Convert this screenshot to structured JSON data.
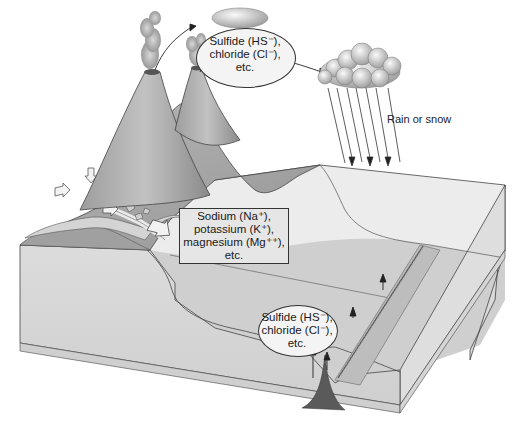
{
  "diagram": {
    "title": "",
    "labels": {
      "atmosphere_oval": {
        "line1": "Sulfide (HS⁻),",
        "line2": "chloride (Cl⁻),",
        "line3": "etc."
      },
      "river_box": {
        "line1": "Sodium (Na⁺),",
        "line2": "potassium (K⁺),",
        "line3": "magnesium (Mg⁺⁺),",
        "line4": "etc."
      },
      "vent_oval": {
        "line1": "Sulfide (HS⁻),",
        "line2": "chloride (Cl⁻),",
        "line3": "etc."
      },
      "rain": "Rain or snow"
    },
    "elements": [
      {
        "name": "volcano-left",
        "kind": "volcano"
      },
      {
        "name": "volcano-right",
        "kind": "volcano"
      },
      {
        "name": "emission-cloud",
        "kind": "cloud"
      },
      {
        "name": "rain-cloud",
        "kind": "cloud"
      },
      {
        "name": "rain-streaks",
        "kind": "precipitation",
        "count": 7
      },
      {
        "name": "river",
        "kind": "runoff",
        "flow_arrows": 6
      },
      {
        "name": "ocean-block",
        "kind": "cross-section"
      },
      {
        "name": "mid-ocean-ridge",
        "kind": "ridge"
      },
      {
        "name": "hydrothermal-vent",
        "kind": "vent",
        "upward_arrows": 4
      }
    ],
    "colors": {
      "background": "#ffffff",
      "land": "#a9a9a9",
      "land_dark": "#8f8f8f",
      "ocean_top": "#e9e9e9",
      "ocean_side": "#d6d6d6",
      "seafloor": "#c4c4c4",
      "vent": "#5a5a5a",
      "outline": "#333333"
    }
  }
}
